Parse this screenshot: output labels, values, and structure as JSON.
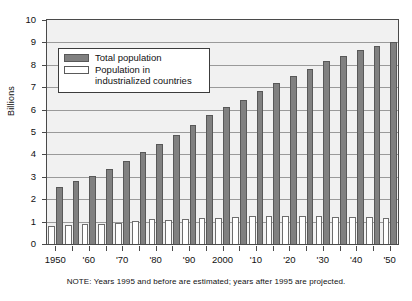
{
  "chart_data": {
    "type": "bar",
    "title": "",
    "subtitle": "",
    "xlabel": "",
    "ylabel": "Billions",
    "ylim": [
      0,
      10
    ],
    "ytick_values": [
      0,
      1,
      2,
      3,
      4,
      5,
      6,
      7,
      8,
      9,
      10
    ],
    "ytick_labels": [
      "0",
      "1",
      "2",
      "3",
      "4",
      "5",
      "6",
      "7",
      "8",
      "9",
      "10"
    ],
    "grid": true,
    "legend_position": "upper-left-inside",
    "x": [
      1950,
      1955,
      1960,
      1965,
      1970,
      1975,
      1980,
      1985,
      1990,
      1995,
      2000,
      2005,
      2010,
      2015,
      2020,
      2025,
      2030,
      2035,
      2040,
      2045,
      2050
    ],
    "categories": [
      "1950",
      "1955",
      "1960",
      "1965",
      "1970",
      "1975",
      "1980",
      "1985",
      "1990",
      "1995",
      "2000",
      "2005",
      "2010",
      "2015",
      "2020",
      "2025",
      "2030",
      "2035",
      "2040",
      "2045",
      "2050"
    ],
    "xtick_labels": [
      {
        "label": "1950",
        "value": 1950
      },
      {
        "label": "'60",
        "value": 1960
      },
      {
        "label": "'70",
        "value": 1970
      },
      {
        "label": "'80",
        "value": 1980
      },
      {
        "label": "'90",
        "value": 1990
      },
      {
        "label": "2000",
        "value": 2000
      },
      {
        "label": "'10",
        "value": 2010
      },
      {
        "label": "'20",
        "value": 2020
      },
      {
        "label": "'30",
        "value": 2030
      },
      {
        "label": "'40",
        "value": 2040
      },
      {
        "label": "'50",
        "value": 2050
      }
    ],
    "series": [
      {
        "name": "Total population",
        "color": "#808080",
        "values": [
          2.55,
          2.8,
          3.05,
          3.35,
          3.7,
          4.1,
          4.45,
          4.85,
          5.3,
          5.75,
          6.1,
          6.45,
          6.85,
          7.2,
          7.5,
          7.8,
          8.15,
          8.4,
          8.65,
          8.85,
          9.0
        ]
      },
      {
        "name": "Population in industrialized countries",
        "color": "#ffffff",
        "values": [
          0.82,
          0.86,
          0.88,
          0.91,
          0.93,
          1.02,
          1.13,
          1.09,
          1.11,
          1.18,
          1.18,
          1.21,
          1.23,
          1.25,
          1.24,
          1.24,
          1.23,
          1.22,
          1.2,
          1.19,
          1.18
        ]
      }
    ],
    "annotations": [
      "NOTE: Years 1995 and before are estimated; years after 1995 are projected."
    ]
  },
  "legend": {
    "items": [
      {
        "label": "Total population",
        "label_line2": "",
        "swatch": "filled-gray-swatch"
      },
      {
        "label": "Population in",
        "label_line2": "industrialized countries",
        "swatch": "hollow-white-swatch"
      }
    ]
  },
  "note": {
    "text": "NOTE: Years 1995 and before are estimated; years after 1995 are projected."
  },
  "axis": {
    "y_title": "Billions"
  }
}
